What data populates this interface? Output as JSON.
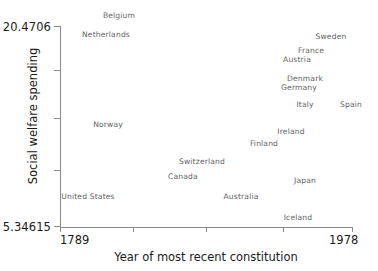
{
  "chart_data": {
    "type": "scatter",
    "title": "",
    "xlabel": "Year of most recent constitution",
    "ylabel": "Social welfare spending",
    "xlim": [
      1789,
      1978
    ],
    "ylim": [
      5.34615,
      20.4706
    ],
    "grid": false,
    "legend": null,
    "marker_style": "text-label-only",
    "xticklabels": [
      "1789",
      "1978"
    ],
    "yticklabels": [
      "20.4706",
      "5.34615"
    ],
    "points": [
      {
        "label": "Belgium",
        "x": 1831,
        "y": 20.4,
        "px": 119,
        "py": 15
      },
      {
        "label": "Netherlands",
        "x": 1815,
        "y": 19.65,
        "px": 106,
        "py": 34
      },
      {
        "label": "Sweden",
        "x": 1975,
        "y": 19.4,
        "px": 331,
        "py": 36
      },
      {
        "label": "France",
        "x": 1958,
        "y": 18.35,
        "px": 311,
        "py": 50
      },
      {
        "label": "Austria",
        "x": 1945,
        "y": 17.9,
        "px": 297,
        "py": 59
      },
      {
        "label": "Denmark",
        "x": 1953,
        "y": 17.05,
        "px": 305,
        "py": 78
      },
      {
        "label": "Germany",
        "x": 1949,
        "y": 16.7,
        "px": 299,
        "py": 87
      },
      {
        "label": "Italy",
        "x": 1948,
        "y": 15.6,
        "px": 305,
        "py": 104
      },
      {
        "label": "Spain",
        "x": 1978,
        "y": 15.55,
        "px": 351,
        "py": 104
      },
      {
        "label": "Norway",
        "x": 1814,
        "y": 13.85,
        "px": 108,
        "py": 124
      },
      {
        "label": "Ireland",
        "x": 1937,
        "y": 13.1,
        "px": 291,
        "py": 131
      },
      {
        "label": "Finland",
        "x": 1919,
        "y": 12.4,
        "px": 264,
        "py": 143
      },
      {
        "label": "Switzerland",
        "x": 1874,
        "y": 11.35,
        "px": 202,
        "py": 161
      },
      {
        "label": "Canada",
        "x": 1867,
        "y": 10.55,
        "px": 183,
        "py": 176
      },
      {
        "label": "Japan",
        "x": 1947,
        "y": 10.4,
        "px": 305,
        "py": 180
      },
      {
        "label": "Australia",
        "x": 1901,
        "y": 9.4,
        "px": 241,
        "py": 196
      },
      {
        "label": "United States",
        "x": 1789,
        "y": 8.95,
        "px": 88,
        "py": 196
      },
      {
        "label": "Iceland",
        "x": 1944,
        "y": 5.6,
        "px": 298,
        "py": 217
      }
    ],
    "y_tick_positions_px": [
      26,
      70,
      118,
      170,
      226
    ],
    "x_tick_positions_px": [
      60,
      133,
      206,
      283,
      352
    ]
  },
  "colors": {
    "axis": "#8a8a8a",
    "tick_label": "#1a1a1a",
    "point_label": "#636363",
    "background": "#ffffff"
  }
}
